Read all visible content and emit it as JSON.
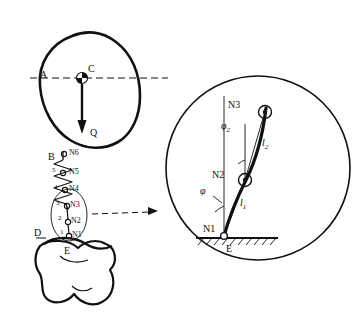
{
  "figure": {
    "title": "",
    "background": "#ffffff",
    "stroke": "#111111"
  },
  "left_diagram": {
    "name": "body-mass-over-pelvis",
    "labels": {
      "A": "A",
      "C": "C",
      "Q": "Q",
      "B": "B",
      "D": "D",
      "E": "E",
      "N6": "N6",
      "N5": "N5",
      "N4": "N4",
      "N3": "N3",
      "N2": "N2",
      "N1": "N1",
      "n5": "5",
      "n4": "4",
      "n3": "3",
      "n2": "2",
      "n1": "1"
    }
  },
  "right_detail": {
    "name": "magnified-spring-chain-detail",
    "labels": {
      "N3": "N3",
      "N2": "N2",
      "N1": "N1",
      "E": "E",
      "phi2": "φ",
      "phi2_sub": "2",
      "phi1": "φ",
      "l2": "l",
      "l2_sub": "2",
      "l1": "l",
      "l1_sub": "1"
    }
  }
}
